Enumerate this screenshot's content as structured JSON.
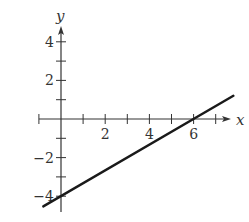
{
  "chart_data": {
    "type": "line",
    "title": "",
    "xlabel": "x",
    "ylabel": "y",
    "xlim": [
      -1,
      8
    ],
    "ylim": [
      -5,
      5
    ],
    "grid": false,
    "legend": null,
    "x_ticks": [
      -1,
      0,
      1,
      2,
      3,
      4,
      5,
      6,
      7
    ],
    "x_tick_labels": [
      {
        "value": 2,
        "label": "2"
      },
      {
        "value": 4,
        "label": "4"
      },
      {
        "value": 6,
        "label": "6"
      }
    ],
    "y_ticks": [
      -4,
      -3,
      -2,
      -1,
      1,
      2,
      3,
      4
    ],
    "y_tick_labels": [
      {
        "value": 4,
        "label": "4"
      },
      {
        "value": 2,
        "label": "2"
      },
      {
        "value": -2,
        "label": "−2"
      },
      {
        "value": -4,
        "label": "−4"
      }
    ],
    "series": [
      {
        "name": "line",
        "equation": "y = (2/3)x - 4",
        "x_intercept": 6,
        "y_intercept": -4,
        "x": [
          -0.8,
          7.8
        ],
        "y": [
          -4.53,
          1.2
        ]
      }
    ]
  },
  "colors": {
    "axis": "#333333",
    "line": "#1a1a1a",
    "background": "#ffffff"
  }
}
